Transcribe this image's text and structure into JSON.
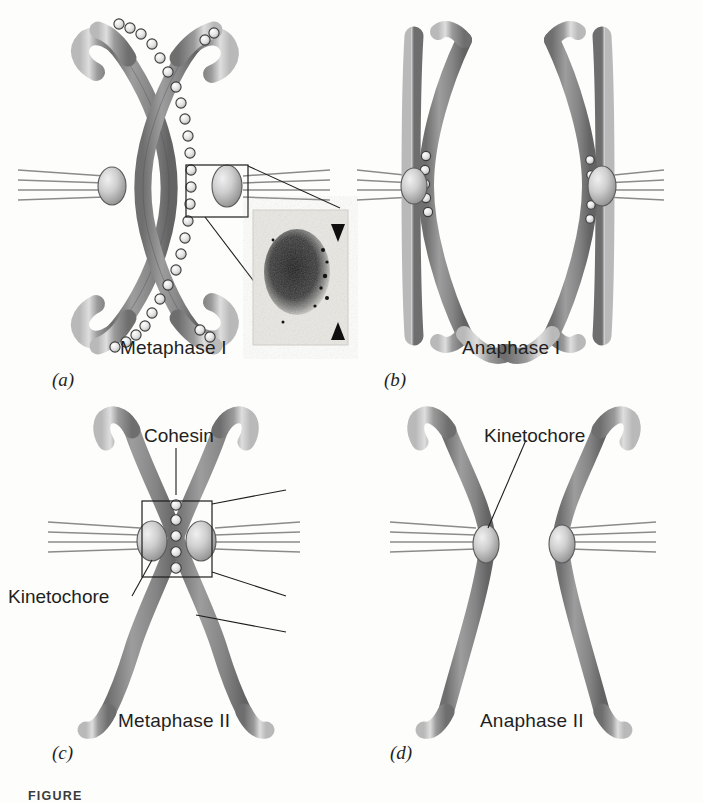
{
  "figure": {
    "caption_prefix": "FIGURE",
    "background_color": "#fdfdfb",
    "ink_color": "#1f1f1f"
  },
  "panels": [
    {
      "id": "a",
      "letter": "(a)",
      "stage_label": "Metaphase I",
      "description": "Bivalent (tetrad) of two homologous chromosomes held together by cohesin along sister chromatid arms, aligned at the metaphase plate with kinetochores of sister chromatids fused and attached to microtubules from one pole.",
      "kinetochore_count": 2,
      "cohesin_visible": true,
      "has_micrograph_inset": true
    },
    {
      "id": "b",
      "letter": "(b)",
      "stage_label": "Anaphase I",
      "description": "Homologous chromosomes separate toward opposite poles; arm cohesin is lost while centromeric cohesin persists holding sister chromatids together.",
      "kinetochore_count": 2,
      "cohesin_visible": true,
      "has_micrograph_inset": false
    },
    {
      "id": "c",
      "letter": "(c)",
      "stage_label": "Metaphase II",
      "description": "A single dyad of two sister chromatids aligned at the metaphase plate; remaining centromeric cohesin holds the sisters together while kinetochores attach to opposite poles.",
      "kinetochore_count": 2,
      "cohesin_visible": true,
      "has_micrograph_inset": true
    },
    {
      "id": "d",
      "letter": "(d)",
      "stage_label": "Anaphase II",
      "description": "Centromeric cohesin is cleaved and sister chromatids separate, moving to opposite poles.",
      "kinetochore_count": 2,
      "cohesin_visible": false,
      "has_micrograph_inset": false
    }
  ],
  "annotations": {
    "cohesin": "Cohesin",
    "kinetochore": "Kinetochore"
  },
  "colors": {
    "chromosome_body": "#8a8a8a",
    "chromosome_highlight": "#d6d6d6",
    "chromosome_outline": "#555555",
    "cohesin_bead_fill": "#e8e8e8",
    "cohesin_bead_outline": "#3c3c3c",
    "kinetochore_fill": "#c9c9c9",
    "kinetochore_outline": "#4a4a4a",
    "microtubule": "#7a7a7a",
    "leader_line": "#222222",
    "micrograph_dark": "#2b2b2b",
    "micrograph_light": "#e6e6e2"
  },
  "micrographs": [
    {
      "panel": "a",
      "shape": "rounded chromatin mass",
      "arrowheads": 2,
      "arrowhead_positions": [
        "top-right",
        "bottom-right"
      ],
      "orientation": "vertical pair of arrowheads on one side"
    },
    {
      "panel": "c",
      "shape": "oval chromatin mass",
      "arrowheads": 2,
      "arrowhead_positions": [
        "left",
        "right"
      ],
      "orientation": "opposed arrowheads flanking the centromere"
    }
  ]
}
